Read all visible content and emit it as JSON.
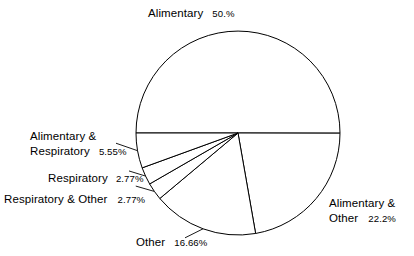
{
  "chart_data": {
    "type": "pie",
    "title": "",
    "subtitle": "",
    "xlabel": "",
    "ylabel": "",
    "legend_position": "none",
    "grid": false,
    "label_format": "name + percent",
    "start_angle_deg": 180,
    "direction": "clockwise",
    "fill": "#ffffff",
    "stroke": "#000000",
    "categories": [
      "Alimentary",
      "Alimentary & Other",
      "Other",
      "Respiratory & Other",
      "Respiratory",
      "Alimentary & Respiratory"
    ],
    "values": [
      50.0,
      22.2,
      16.66,
      2.77,
      2.77,
      5.55
    ],
    "slices": [
      {
        "name": "Alimentary",
        "percent_text": "50.%",
        "value": 50.0,
        "label_position": "top",
        "leader_line": false
      },
      {
        "name": "Alimentary &",
        "name_line2": "Other",
        "percent_text": "22.2%",
        "value": 22.2,
        "label_position": "right",
        "leader_line": false
      },
      {
        "name": "Other",
        "percent_text": "16.66%",
        "value": 16.66,
        "label_position": "bottom",
        "leader_line": true
      },
      {
        "name": "Respiratory & Other",
        "percent_text": "2.77%",
        "value": 2.77,
        "label_position": "left",
        "leader_line": true
      },
      {
        "name": "Respiratory",
        "percent_text": "2.77%",
        "value": 2.77,
        "label_position": "left",
        "leader_line": true
      },
      {
        "name": "Alimentary &",
        "name_line2": "Respiratory",
        "percent_text": "5.55%",
        "value": 5.55,
        "label_position": "left",
        "leader_line": true
      }
    ]
  },
  "labels": {
    "alimentary": {
      "name": "Alimentary",
      "percent": "50.%"
    },
    "alimentary_other": {
      "name_line1": "Alimentary &",
      "name_line2": "Other",
      "percent": "22.2%"
    },
    "other": {
      "name": "Other",
      "percent": "16.66%"
    },
    "respiratory_other": {
      "name": "Respiratory & Other",
      "percent": "2.77%"
    },
    "respiratory": {
      "name": "Respiratory",
      "percent": "2.77%"
    },
    "alimentary_respiratory": {
      "name_line1": "Alimentary &",
      "name_line2": "Respiratory",
      "percent": "5.55%"
    }
  },
  "colors": {
    "background": "#ffffff",
    "outline": "#000000",
    "text": "#000000"
  }
}
